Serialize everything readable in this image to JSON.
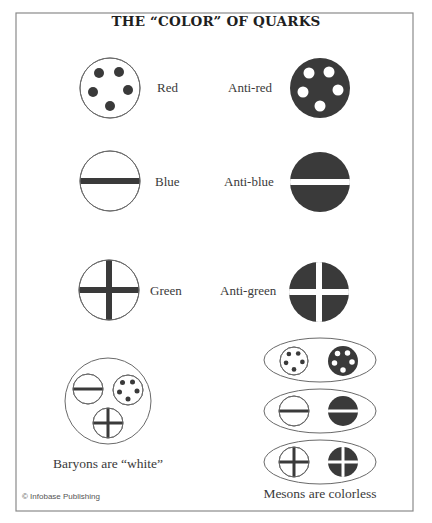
{
  "title": "THE “COLOR” OF QUARKS",
  "credit": "© Infobase Publishing",
  "colors": {
    "ink": "#3a3a3a",
    "fill_dark": "#3a3a3a",
    "paper": "#ffffff",
    "frame": "#8a8a8a",
    "outline": "#6a6a6a"
  },
  "frame": {
    "x": 16,
    "y": 13,
    "width": 397,
    "height": 498
  },
  "quarks": [
    {
      "id": "red",
      "label": "Red",
      "pattern": "dots",
      "inverted": false,
      "cx": 110,
      "cy": 88,
      "r": 30,
      "label_x": 157,
      "label_y": 92
    },
    {
      "id": "anti-red",
      "label": "Anti-red",
      "pattern": "dots",
      "inverted": true,
      "cx": 320,
      "cy": 88,
      "r": 30,
      "label_x": 228,
      "label_y": 92,
      "label_anchor": "start"
    },
    {
      "id": "blue",
      "label": "Blue",
      "pattern": "bar",
      "inverted": false,
      "cx": 110,
      "cy": 181,
      "r": 30,
      "label_x": 155,
      "label_y": 186
    },
    {
      "id": "anti-blue",
      "label": "Anti-blue",
      "pattern": "bar",
      "inverted": true,
      "cx": 320,
      "cy": 182,
      "r": 30,
      "label_x": 224,
      "label_y": 186,
      "label_anchor": "start"
    },
    {
      "id": "green",
      "label": "Green",
      "pattern": "cross",
      "inverted": false,
      "cx": 109,
      "cy": 290,
      "r": 30,
      "label_x": 150,
      "label_y": 295
    },
    {
      "id": "anti-green",
      "label": "Anti-green",
      "pattern": "cross",
      "inverted": true,
      "cx": 319,
      "cy": 292,
      "r": 30,
      "label_x": 220,
      "label_y": 295,
      "label_anchor": "start"
    }
  ],
  "baryon": {
    "caption": "Baryons are “white”",
    "caption_x": 108,
    "caption_y": 468,
    "cx": 108,
    "cy": 401,
    "r": 43,
    "members": [
      {
        "pattern": "bar",
        "inverted": false,
        "cx": 88,
        "cy": 389,
        "r": 15
      },
      {
        "pattern": "dots",
        "inverted": false,
        "cx": 128,
        "cy": 390,
        "r": 15
      },
      {
        "pattern": "cross",
        "inverted": false,
        "cx": 108,
        "cy": 423,
        "r": 15
      }
    ]
  },
  "mesons": {
    "caption": "Mesons are colorless",
    "caption_x": 320,
    "caption_y": 498,
    "pairs": [
      {
        "name": "red-antired",
        "cx": 320,
        "cy": 360,
        "rx": 56,
        "ry": 22,
        "members": [
          {
            "pattern": "dots",
            "inverted": false,
            "cx": 294,
            "cy": 361,
            "r": 14
          },
          {
            "pattern": "dots",
            "inverted": true,
            "cx": 343,
            "cy": 361,
            "r": 15
          }
        ]
      },
      {
        "name": "blue-antiblue",
        "cx": 320,
        "cy": 411,
        "rx": 56,
        "ry": 22,
        "members": [
          {
            "pattern": "bar",
            "inverted": false,
            "cx": 294,
            "cy": 411,
            "r": 15
          },
          {
            "pattern": "bar",
            "inverted": true,
            "cx": 343,
            "cy": 411,
            "r": 15
          }
        ]
      },
      {
        "name": "green-antigreen",
        "cx": 320,
        "cy": 462,
        "rx": 56,
        "ry": 22,
        "members": [
          {
            "pattern": "cross",
            "inverted": false,
            "cx": 294,
            "cy": 462,
            "r": 15
          },
          {
            "pattern": "cross",
            "inverted": true,
            "cx": 343,
            "cy": 462,
            "r": 15
          }
        ]
      }
    ]
  }
}
